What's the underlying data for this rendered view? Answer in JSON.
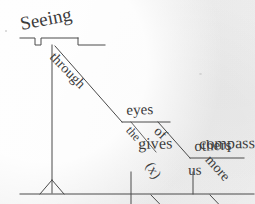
{
  "diagram": {
    "type": "reed-kellogg-sentence-diagram",
    "sentence": "Seeing through the eyes of others gives us more compassion.",
    "background_color": "#f1f1f1",
    "ink_color": "#3b3b3b",
    "line_color": "#4a4a4a",
    "labels": {
      "gerund_subject": "Seeing",
      "preposition_through": "through",
      "object_eyes": "eyes",
      "article_the": "the",
      "preposition_of": "of",
      "object_others": "others",
      "verb_gives": "gives",
      "direct_object_compassion": "compassion",
      "indirect_object_marker": "(x)",
      "indirect_object_us": "us",
      "modifier_more": "more"
    },
    "parts_of_speech": {
      "Seeing": "gerund (subject)",
      "through": "preposition",
      "the": "article",
      "eyes": "object of preposition",
      "of": "preposition",
      "others": "object of preposition",
      "gives": "verb",
      "compassion": "direct object",
      "(x)": "implied preposition",
      "us": "indirect object",
      "more": "adjective"
    }
  }
}
